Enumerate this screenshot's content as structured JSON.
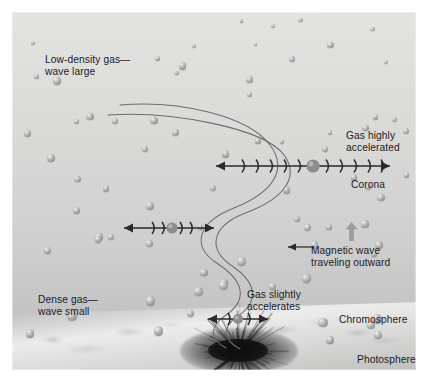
{
  "figure": {
    "type": "scientific-illustration"
  },
  "labels": {
    "low_density": "Low-density gas—\nwave large",
    "dense_gas": "Dense gas—\nwave small",
    "gas_highly_accelerated": "Gas highly\naccelerated",
    "corona": "Corona",
    "magnetic_wave": "Magnetic wave\ntraveling outward",
    "chromosphere": "Chromosphere",
    "photosphere": "Photosphere",
    "gas_slightly_accelerates": "Gas slightly\naccelerates"
  },
  "layers": [
    {
      "name": "Corona",
      "position": "upper",
      "gas_density": "low",
      "wave_amplitude": "large"
    },
    {
      "name": "Chromosphere",
      "position": "middle",
      "gas_density": "medium",
      "wave_amplitude": "medium"
    },
    {
      "name": "Photosphere",
      "position": "lower",
      "gas_density": "dense",
      "wave_amplitude": "small"
    }
  ],
  "oscillation_markers": {
    "top": {
      "left_brackets": 5,
      "right_brackets": 5,
      "amplitude": "large",
      "label": "Gas highly accelerated"
    },
    "middle": {
      "left_brackets": 2,
      "right_brackets": 2,
      "amplitude": "medium"
    },
    "bottom": {
      "left_brackets": 1,
      "right_brackets": 1,
      "amplitude": "small",
      "label": "Gas slightly accelerates"
    }
  },
  "colors": {
    "background_top": "#e3e3e2",
    "background_bottom": "#bbbbba",
    "text": "#20201f",
    "wave_line": "#6d6d6b",
    "arrow": "#2a2a29",
    "particle": "#9a9a98",
    "sunspot": "#141414",
    "page": "#ffffff"
  },
  "features": {
    "sunspot": "dark sunspot with radiating filaments at photosphere base",
    "wave_count": 2,
    "particles_visible": true,
    "up_arrow": "gray block arrow indicating outward direction"
  }
}
